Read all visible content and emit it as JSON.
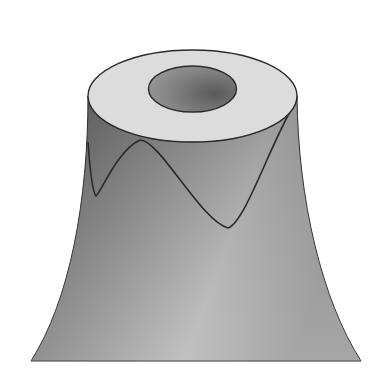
{
  "figure": {
    "colors": {
      "background": "#ffffff",
      "top_face": "#dedede",
      "body_dark": "#6a6a6a",
      "body_light": "#bdbdbd",
      "hole_dark": "#5a5a5a",
      "hole_light": "#9a9a9a",
      "outline": "#2a2a2a"
    }
  }
}
